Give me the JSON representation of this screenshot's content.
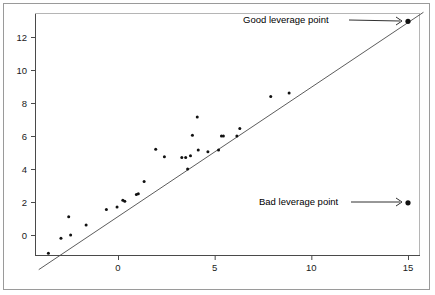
{
  "figure": {
    "kind": "scatter-plot-figure",
    "border_color": "#9a9a9a",
    "axis_color": "#4a4a4a",
    "point_color": "#111111",
    "line_color": "#4a4a4a",
    "background": "#ffffff"
  },
  "annotations": [
    {
      "name": "good-leverage-annotation",
      "text": "Good leverage point",
      "text_x": 243,
      "text_y": 23,
      "arrow_from_x": 349,
      "arrow_from_y": 20,
      "arrow_to_x": 404,
      "arrow_to_y": 21
    },
    {
      "name": "bad-leverage-annotation",
      "text": "Bad leverage point",
      "text_x": 259,
      "text_y": 205,
      "arrow_from_x": 351,
      "arrow_from_y": 202,
      "arrow_to_x": 404,
      "arrow_to_y": 202
    }
  ],
  "chart_data": {
    "type": "scatter",
    "title": "",
    "xlabel": "",
    "ylabel": "",
    "xlim": [
      -4.6,
      16.2
    ],
    "ylim": [
      -2.3,
      13.6
    ],
    "xticks": [
      0,
      5,
      10,
      15
    ],
    "yticks": [
      0,
      2,
      4,
      6,
      8,
      10,
      12
    ],
    "grid": false,
    "legend": null,
    "regression_line": {
      "name": "fitted-regression-line",
      "x_start": -4.1,
      "y_start": -2.1,
      "x_end": 15.8,
      "y_end": 13.5,
      "slope": 0.784,
      "intercept": 1.11
    },
    "points": [
      {
        "x": -3.6,
        "y": -1.1
      },
      {
        "x": -2.95,
        "y": -0.2
      },
      {
        "x": -2.55,
        "y": 1.1
      },
      {
        "x": -2.45,
        "y": 0.0
      },
      {
        "x": -1.65,
        "y": 0.6
      },
      {
        "x": -0.6,
        "y": 1.55
      },
      {
        "x": -0.05,
        "y": 1.7
      },
      {
        "x": 0.25,
        "y": 2.1
      },
      {
        "x": 0.35,
        "y": 2.05
      },
      {
        "x": 0.95,
        "y": 2.45
      },
      {
        "x": 1.05,
        "y": 2.5
      },
      {
        "x": 1.35,
        "y": 3.25
      },
      {
        "x": 1.95,
        "y": 5.2
      },
      {
        "x": 2.4,
        "y": 4.75
      },
      {
        "x": 3.3,
        "y": 4.7
      },
      {
        "x": 3.5,
        "y": 4.7
      },
      {
        "x": 3.6,
        "y": 4.0
      },
      {
        "x": 3.75,
        "y": 4.8
      },
      {
        "x": 3.85,
        "y": 6.05
      },
      {
        "x": 4.1,
        "y": 7.15
      },
      {
        "x": 4.15,
        "y": 5.15
      },
      {
        "x": 4.65,
        "y": 5.05
      },
      {
        "x": 5.2,
        "y": 5.15
      },
      {
        "x": 5.35,
        "y": 6.0
      },
      {
        "x": 5.45,
        "y": 6.0
      },
      {
        "x": 6.15,
        "y": 6.0
      },
      {
        "x": 6.3,
        "y": 6.45
      },
      {
        "x": 7.9,
        "y": 8.4
      },
      {
        "x": 8.85,
        "y": 8.6
      },
      {
        "x": 15.0,
        "y": 12.95,
        "label": "Good leverage point"
      },
      {
        "x": 15.0,
        "y": 1.95,
        "label": "Bad leverage point"
      }
    ],
    "highlighted_points": [
      {
        "name": "good-leverage-point",
        "x": 15.0,
        "y": 12.95,
        "radius": 2.6
      },
      {
        "name": "bad-leverage-point",
        "x": 15.0,
        "y": 1.95,
        "radius": 2.6
      }
    ]
  },
  "axes": {
    "x_axis": {
      "name": "x-axis",
      "pixel_zero": 118,
      "pixel_per_unit": 19.333
    },
    "y_axis": {
      "name": "y-axis",
      "pixel_zero": 235,
      "pixel_per_unit": 16.5
    },
    "plot_left": 35,
    "plot_right": 420,
    "plot_top": 13,
    "plot_bottom": 255
  }
}
